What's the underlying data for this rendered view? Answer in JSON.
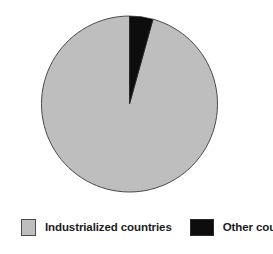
{
  "chart_data": {
    "type": "pie",
    "title": "",
    "subtitle": "",
    "xlabel": "",
    "ylabel": "",
    "grid": false,
    "legend_position": "bottom",
    "start_angle_deg": 0,
    "direction": "clockwise",
    "categories": [
      "Industrialized countries",
      "Other countries"
    ],
    "values": [
      95.7,
      4.3
    ],
    "unit": "percent",
    "slices": [
      {
        "label": "Industrialized countries",
        "value": 95.7,
        "angle_deg": 344.5,
        "color": "#bebebe",
        "stroke": "#4a4a4a"
      },
      {
        "label": "Other countries",
        "value": 4.3,
        "angle_deg": 15.5,
        "color": "#0d0d0d",
        "stroke": "#2b2b2b"
      }
    ],
    "annotations": []
  },
  "geometry": {
    "center_x": 129.5,
    "center_y": 104,
    "radius": 88
  },
  "legend": {
    "entries": [
      {
        "label": "Industrialized countries",
        "swatch_color": "#bebebe",
        "swatch_icon": "legend-swatch-gray-icon"
      },
      {
        "label": "Other countries",
        "swatch_color": "#0d0d0d",
        "swatch_icon": "legend-swatch-black-icon"
      }
    ]
  },
  "colors": {
    "background": "#ffffff",
    "slice_primary": "#bebebe",
    "slice_secondary": "#0d0d0d",
    "outline": "#4a4a4a",
    "text": "#1c1c1c"
  }
}
